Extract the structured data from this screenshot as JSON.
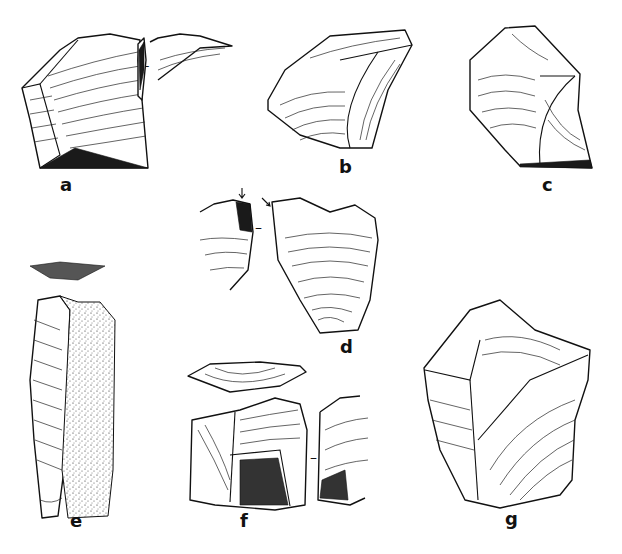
{
  "figure": {
    "type": "archaeological lithic illustration plate",
    "background": "#ffffff",
    "ink_color": "#111111",
    "artifacts": [
      {
        "id": "a",
        "label": "a",
        "views": [
          "dorsal face",
          "profile"
        ],
        "separator": "-"
      },
      {
        "id": "b",
        "label": "b",
        "views": [
          "dorsal face"
        ]
      },
      {
        "id": "c",
        "label": "c",
        "views": [
          "dorsal face"
        ]
      },
      {
        "id": "d",
        "label": "d",
        "views": [
          "profile",
          "dorsal face"
        ],
        "separator": "-",
        "arrows": 2
      },
      {
        "id": "e",
        "label": "e",
        "views": [
          "platform",
          "dorsal face"
        ],
        "cortex": "stippled"
      },
      {
        "id": "f",
        "label": "f",
        "views": [
          "platform",
          "dorsal face",
          "profile"
        ],
        "separator": "-"
      },
      {
        "id": "g",
        "label": "g",
        "views": [
          "dorsal face"
        ]
      }
    ]
  }
}
